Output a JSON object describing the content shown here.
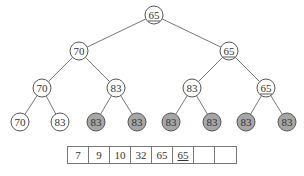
{
  "tree": {
    "nodes": [
      {
        "id": "n0",
        "value": "65",
        "x": 154,
        "y": 15,
        "fill": "white",
        "underline": true
      },
      {
        "id": "n1",
        "value": "70",
        "x": 79,
        "y": 51,
        "fill": "white",
        "underline": false
      },
      {
        "id": "n2",
        "value": "65",
        "x": 229,
        "y": 51,
        "fill": "white",
        "underline": true
      },
      {
        "id": "n3",
        "value": "70",
        "x": 42,
        "y": 88,
        "fill": "white",
        "underline": false
      },
      {
        "id": "n4",
        "value": "83",
        "x": 116,
        "y": 88,
        "fill": "white",
        "underline": false
      },
      {
        "id": "n5",
        "value": "83",
        "x": 192,
        "y": 88,
        "fill": "white",
        "underline": false
      },
      {
        "id": "n6",
        "value": "65",
        "x": 266,
        "y": 88,
        "fill": "white",
        "underline": true
      },
      {
        "id": "n7",
        "value": "70",
        "x": 20,
        "y": 122,
        "fill": "white",
        "underline": false
      },
      {
        "id": "n8",
        "value": "83",
        "x": 60,
        "y": 122,
        "fill": "white",
        "underline": false
      },
      {
        "id": "n9",
        "value": "83",
        "x": 96,
        "y": 122,
        "fill": "gray",
        "underline": false
      },
      {
        "id": "n10",
        "value": "83",
        "x": 137,
        "y": 122,
        "fill": "gray",
        "underline": false
      },
      {
        "id": "n11",
        "value": "83",
        "x": 171,
        "y": 122,
        "fill": "gray",
        "underline": false
      },
      {
        "id": "n12",
        "value": "83",
        "x": 212,
        "y": 122,
        "fill": "gray",
        "underline": false
      },
      {
        "id": "n13",
        "value": "83",
        "x": 246,
        "y": 122,
        "fill": "gray",
        "underline": false
      },
      {
        "id": "n14",
        "value": "83",
        "x": 287,
        "y": 122,
        "fill": "gray",
        "underline": false
      }
    ],
    "edges": [
      [
        "n0",
        "n1"
      ],
      [
        "n0",
        "n2"
      ],
      [
        "n1",
        "n3"
      ],
      [
        "n1",
        "n4"
      ],
      [
        "n2",
        "n5"
      ],
      [
        "n2",
        "n6"
      ],
      [
        "n3",
        "n7"
      ],
      [
        "n3",
        "n8"
      ],
      [
        "n4",
        "n9"
      ],
      [
        "n4",
        "n10"
      ],
      [
        "n5",
        "n11"
      ],
      [
        "n5",
        "n12"
      ],
      [
        "n6",
        "n13"
      ],
      [
        "n6",
        "n14"
      ]
    ],
    "colors": {
      "white": "#ffffff",
      "gray": "#a6a6a6",
      "stroke": "#555555"
    }
  },
  "array": {
    "cells": [
      {
        "value": "7",
        "underline": false
      },
      {
        "value": "9",
        "underline": false
      },
      {
        "value": "10",
        "underline": false
      },
      {
        "value": "32",
        "underline": false
      },
      {
        "value": "65",
        "underline": false
      },
      {
        "value": "65",
        "underline": true
      },
      {
        "value": "",
        "underline": false
      },
      {
        "value": "",
        "underline": false
      }
    ]
  }
}
